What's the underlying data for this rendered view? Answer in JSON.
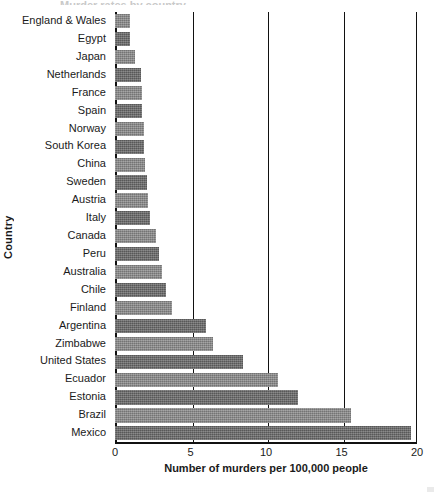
{
  "chart_data": {
    "type": "bar",
    "orientation": "horizontal",
    "title": "",
    "xlabel": "Number of murders per 100,000 people",
    "ylabel": "Country",
    "xlim": [
      0,
      20
    ],
    "ylim": null,
    "grid": true,
    "grid_axis": "x",
    "legend": null,
    "xticks": [
      0,
      5,
      10,
      15,
      20
    ],
    "xtick_labels": [
      "0",
      "5",
      "10",
      "15",
      "20"
    ],
    "categories": [
      "England & Wales",
      "Egypt",
      "Japan",
      "Netherlands",
      "France",
      "Spain",
      "Norway",
      "South Korea",
      "China",
      "Sweden",
      "Austria",
      "Italy",
      "Canada",
      "Peru",
      "Australia",
      "Chile",
      "Finland",
      "Argentina",
      "Zimbabwe",
      "United States",
      "Ecuador",
      "Estonia",
      "Brazil",
      "Mexico"
    ],
    "values": [
      1.0,
      1.0,
      1.3,
      1.7,
      1.8,
      1.8,
      1.9,
      1.9,
      2.0,
      2.1,
      2.2,
      2.3,
      2.7,
      2.9,
      3.1,
      3.4,
      3.8,
      6.0,
      6.5,
      8.5,
      10.8,
      12.1,
      15.6,
      19.6
    ],
    "bar_color": "#7b7b7b",
    "bar_color_dark": "#6a6a6a",
    "bar_color_light": "#8c8c8c",
    "axis_color": "#111111",
    "text_color": "#1a1a1a"
  },
  "axis": {
    "x_title": "Number of murders per 100,000 people",
    "y_title": "Country"
  },
  "title_remnant": "Murder rates by country"
}
